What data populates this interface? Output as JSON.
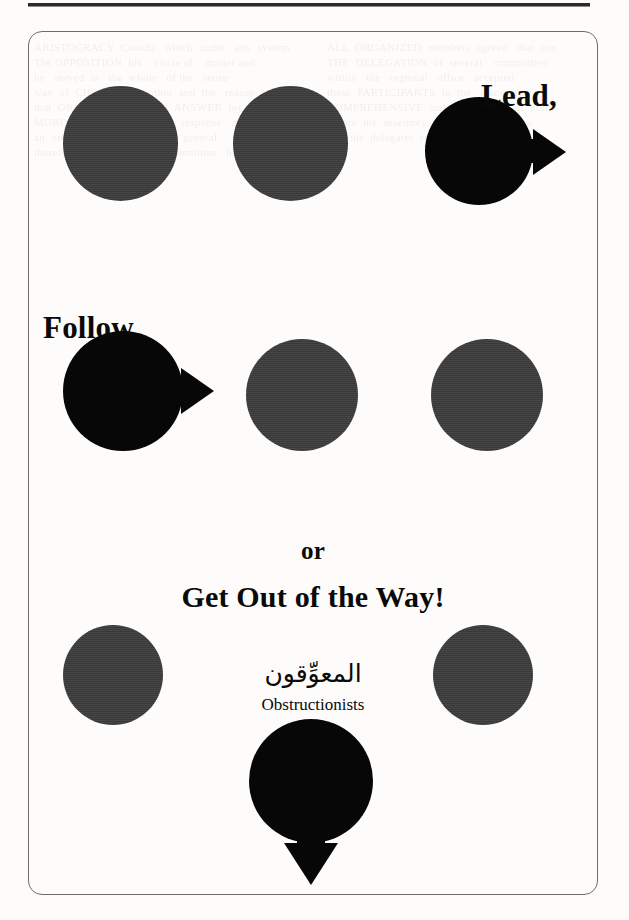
{
  "page": {
    "background_color": "#fdfcfb",
    "rule_color": "#2b2b2b",
    "frame_color": "#6d6d6d"
  },
  "figure": {
    "captions": {
      "lead": "Lead,",
      "follow": "Follow,",
      "or": "or",
      "get_out": "Get Out of the Way!"
    },
    "label": {
      "arabic": "المعوِّقون",
      "english": "Obstructionists"
    },
    "colors": {
      "passive_node": "#3b3b3b",
      "active_node": "#070707",
      "arrow": "#070707"
    },
    "rows": [
      {
        "name": "row-lead",
        "nodes": [
          {
            "name": "node-passive-1",
            "kind": "passive",
            "x": 62,
            "y": 85,
            "size": 115,
            "arrow": "none"
          },
          {
            "name": "node-passive-2",
            "kind": "passive",
            "x": 232,
            "y": 85,
            "size": 115,
            "arrow": "none"
          },
          {
            "name": "node-leader",
            "kind": "active",
            "x": 424,
            "y": 96,
            "size": 108,
            "arrow": "right"
          }
        ]
      },
      {
        "name": "row-follow",
        "nodes": [
          {
            "name": "node-follower",
            "kind": "active",
            "x": 62,
            "y": 330,
            "size": 120,
            "arrow": "right"
          },
          {
            "name": "node-passive-3",
            "kind": "passive",
            "x": 245,
            "y": 338,
            "size": 112,
            "arrow": "none"
          },
          {
            "name": "node-passive-4",
            "kind": "passive",
            "x": 430,
            "y": 338,
            "size": 112,
            "arrow": "none"
          }
        ]
      },
      {
        "name": "row-obstructionists",
        "nodes": [
          {
            "name": "node-passive-5",
            "kind": "passive",
            "x": 62,
            "y": 624,
            "size": 100,
            "arrow": "none"
          },
          {
            "name": "node-passive-6",
            "kind": "passive",
            "x": 432,
            "y": 624,
            "size": 100,
            "arrow": "none"
          },
          {
            "name": "node-exiting",
            "kind": "active",
            "x": 248,
            "y": 718,
            "size": 124,
            "arrow": "down"
          }
        ]
      }
    ]
  },
  "ghost": {
    "text": "ARISTOCRACY  Canada   which  under   any  system\nThe OPPOSITION  his    circle of    matter and\nhe   served  at   the  whole   of the   sense\nway  of  CHANGE  so   other  and  the   reason\nthat  ORGANIZATION  will  ANSWER  for   the\nMOROCCO  in   a  measured   response   and\nan  ordinary  council  of   the    general\ntherefore   the   organizing   committee   has\nALL  ORGANIZED  members  agreed   that  any\nTHE  DELEGATION  of  several    committees\nwithin   the   regional   office   accepted\nthese  PARTICIPANTS  in  the   discussion\nCOMPREHENSIVE  and   considered  all  points\nbefore  the  assembly  convened  in  session\nand  the  delegates  returned  to  their  work"
  }
}
